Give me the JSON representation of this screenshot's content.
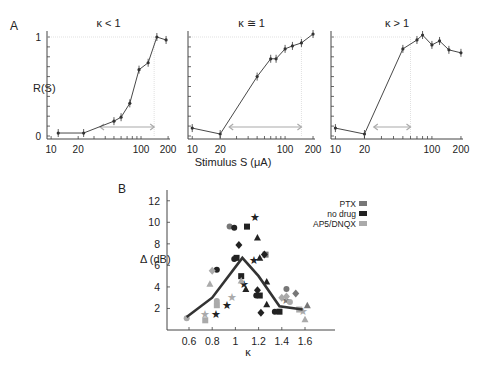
{
  "panel_labels": {
    "a": "A",
    "b": "B"
  },
  "panelA": {
    "ylabel": "R(S)",
    "xlabel": "Stimulus S (μA)",
    "yticks": [
      "0",
      "1"
    ],
    "xticks": [
      "10",
      "20",
      "100",
      "200"
    ]
  },
  "panelB": {
    "ylabel": "Δ (dB)",
    "xlabel": "κ",
    "legend": [
      {
        "label": "PTX",
        "color": "#777777"
      },
      {
        "label": "no drug",
        "color": "#222222"
      },
      {
        "label": "AP5/DNQX",
        "color": "#aaaaaa"
      }
    ]
  },
  "chart_data": [
    {
      "type": "line",
      "title": "κ < 1",
      "xlabel": "Stimulus S (μA)",
      "ylabel": "R(S)",
      "xscale": "log",
      "x": [
        12,
        23,
        50,
        60,
        75,
        95,
        120,
        150,
        190
      ],
      "values": [
        0.03,
        0.03,
        0.15,
        0.19,
        0.33,
        0.67,
        0.74,
        1.0,
        0.97
      ],
      "ylim": [
        0,
        1.05
      ],
      "xlim": [
        9,
        210
      ],
      "arrow_range": [
        35,
        140
      ]
    },
    {
      "type": "line",
      "title": "κ ≅ 1",
      "xlabel": "Stimulus S (μA)",
      "ylabel": "R(S)",
      "xscale": "log",
      "x": [
        10,
        20,
        50,
        70,
        80,
        100,
        120,
        150,
        200
      ],
      "values": [
        0.08,
        0.02,
        0.6,
        0.78,
        0.78,
        0.88,
        0.91,
        0.94,
        1.03
      ],
      "ylim": [
        0,
        1.05
      ],
      "xlim": [
        9,
        210
      ],
      "arrow_range": [
        25,
        150
      ]
    },
    {
      "type": "line",
      "title": "κ > 1",
      "xlabel": "Stimulus S (μA)",
      "ylabel": "R(S)",
      "xscale": "log",
      "x": [
        10,
        20,
        50,
        70,
        80,
        100,
        120,
        150,
        200
      ],
      "values": [
        0.08,
        0.02,
        0.88,
        0.97,
        1.02,
        0.92,
        0.96,
        0.87,
        0.84
      ],
      "ylim": [
        0,
        1.05
      ],
      "xlim": [
        9,
        210
      ],
      "arrow_range": [
        25,
        60
      ]
    },
    {
      "type": "scatter",
      "title": "",
      "xlabel": "κ",
      "ylabel": "Δ (dB)",
      "xlim": [
        0.55,
        1.8
      ],
      "ylim": [
        0,
        13
      ],
      "xticks": [
        0.6,
        0.8,
        1,
        1.2,
        1.4,
        1.6
      ],
      "yticks": [
        2,
        4,
        6,
        8,
        10,
        12
      ],
      "legend_position": "upper right",
      "series": [
        {
          "name": "mean (line)",
          "x": [
            0.58,
            0.8,
            1.06,
            1.2,
            1.38,
            1.58
          ],
          "y": [
            1.2,
            3.0,
            6.7,
            5.0,
            2.2,
            1.9
          ]
        },
        {
          "name": "PTX",
          "color": "#777777",
          "points": [
            [
              0.95,
              9.6
            ],
            [
              1.26,
              7.0
            ],
            [
              1.44,
              2.8
            ],
            [
              1.62,
              2.3
            ],
            [
              1.52,
              3.4
            ],
            [
              1.44,
              3.8
            ]
          ]
        },
        {
          "name": "no drug",
          "color": "#222222",
          "points": [
            [
              0.99,
              9.5
            ],
            [
              1.1,
              9.6
            ],
            [
              1.17,
              10.5
            ],
            [
              1.19,
              8.6
            ],
            [
              1.03,
              7.9
            ],
            [
              0.99,
              6.6
            ],
            [
              1.01,
              6.7
            ],
            [
              1.16,
              6.5
            ],
            [
              1.21,
              6.7
            ],
            [
              1.25,
              7.0
            ],
            [
              0.84,
              5.6
            ],
            [
              1.05,
              5.0
            ],
            [
              1.07,
              4.3
            ],
            [
              1.09,
              3.8
            ],
            [
              1.19,
              3.7
            ],
            [
              1.18,
              3.2
            ],
            [
              1.21,
              3.2
            ],
            [
              0.93,
              2.3
            ],
            [
              1.27,
              2.4
            ],
            [
              1.22,
              1.6
            ],
            [
              1.34,
              1.7
            ],
            [
              1.38,
              1.7
            ],
            [
              0.83,
              1.5
            ],
            [
              1.27,
              4.5
            ]
          ]
        },
        {
          "name": "AP5/DNQX",
          "color": "#aaaaaa",
          "points": [
            [
              0.58,
              1.1
            ],
            [
              0.74,
              0.9
            ],
            [
              0.74,
              1.5
            ],
            [
              0.78,
              4.3
            ],
            [
              0.8,
              5.5
            ],
            [
              0.84,
              2.7
            ],
            [
              0.84,
              2.3
            ],
            [
              0.97,
              3.1
            ],
            [
              1.05,
              4.6
            ],
            [
              1.44,
              3.1
            ],
            [
              1.47,
              2.6
            ],
            [
              1.55,
              1.9
            ],
            [
              1.58,
              1.8
            ],
            [
              1.6,
              1.0
            ],
            [
              1.4,
              3.0
            ]
          ]
        }
      ]
    }
  ]
}
